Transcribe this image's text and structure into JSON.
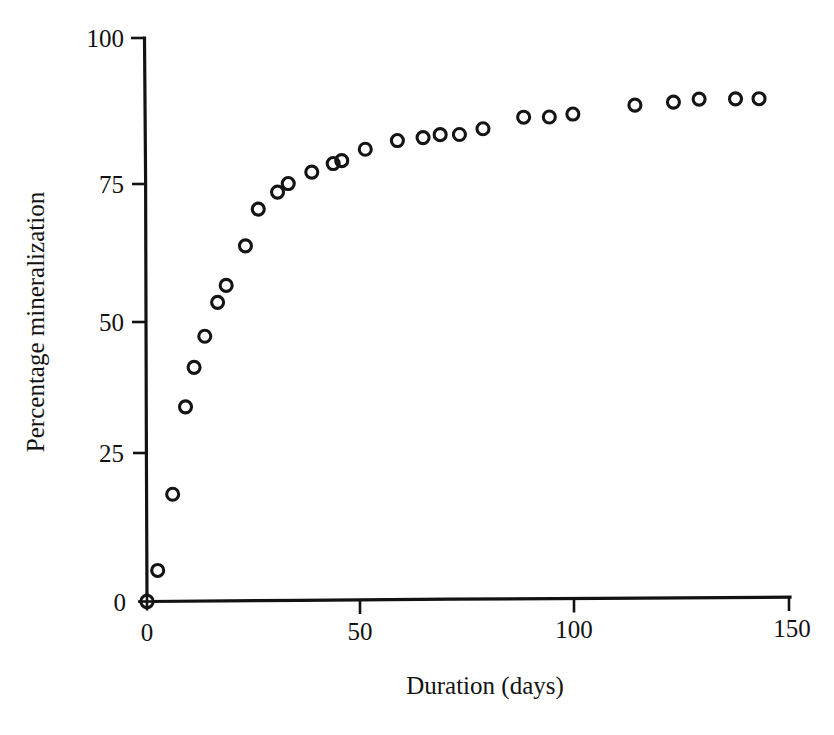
{
  "chart_data": {
    "type": "scatter",
    "title": "",
    "xlabel": "Duration (days)",
    "ylabel": "Percentage mineralization",
    "xlim": [
      0,
      150
    ],
    "ylim": [
      0,
      100
    ],
    "xticks": [
      0,
      50,
      100,
      150
    ],
    "yticks": [
      0,
      25,
      50,
      75,
      100
    ],
    "xtick_labels": [
      "0",
      "50",
      "100",
      "150"
    ],
    "ytick_labels": [
      "0",
      "25",
      "50",
      "75",
      "100"
    ],
    "grid": false,
    "legend": null,
    "marker": "open-circle",
    "marker_color": "#141414",
    "series": [
      {
        "name": "mineralization",
        "points": [
          [
            0,
            0
          ],
          [
            2.5,
            5.5
          ],
          [
            6.0,
            19.0
          ],
          [
            9.0,
            34.5
          ],
          [
            11.0,
            41.5
          ],
          [
            13.5,
            47.0
          ],
          [
            16.5,
            53.0
          ],
          [
            18.5,
            56.0
          ],
          [
            23.0,
            63.0
          ],
          [
            26.0,
            69.5
          ],
          [
            30.5,
            72.5
          ],
          [
            33.0,
            74.0
          ],
          [
            38.5,
            76.0
          ],
          [
            43.5,
            77.5
          ],
          [
            45.5,
            78.0
          ],
          [
            51.0,
            80.0
          ],
          [
            58.5,
            81.5
          ],
          [
            64.5,
            82.0
          ],
          [
            68.5,
            82.5
          ],
          [
            73.0,
            82.5
          ],
          [
            78.5,
            83.5
          ],
          [
            88.0,
            85.5
          ],
          [
            94.0,
            85.5
          ],
          [
            99.5,
            86.0
          ],
          [
            114.0,
            87.5
          ],
          [
            123.0,
            88.0
          ],
          [
            129.0,
            88.5
          ],
          [
            137.5,
            88.5
          ],
          [
            143.0,
            88.5
          ]
        ]
      }
    ]
  },
  "figure": {
    "axes": {
      "x_axis_name": "duration-axis",
      "y_axis_name": "mineralization-axis"
    }
  }
}
